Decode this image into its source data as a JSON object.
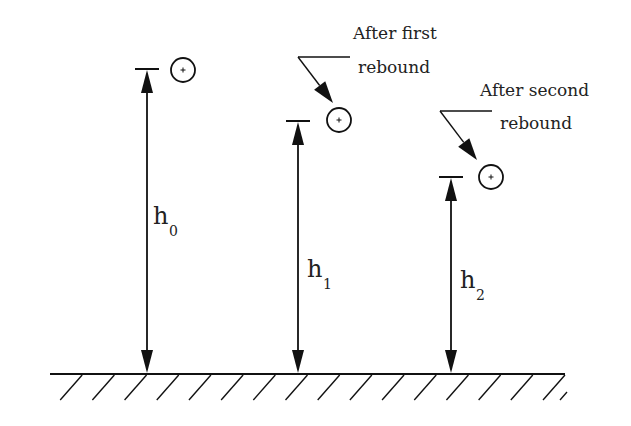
{
  "diagram": {
    "colors": {
      "stroke": "#111111",
      "background": "#ffffff",
      "text": "#222222"
    },
    "ground": {
      "y": 374,
      "x1": 50,
      "x2": 565,
      "hatch_count": 16
    },
    "heights": [
      {
        "id": "h0",
        "symbol": "h",
        "subscript": "0",
        "x": 147,
        "top": 69,
        "label_x": 153,
        "label_y": 224,
        "sub_x": 169,
        "sub_y": 236,
        "ball": {
          "cx": 183,
          "cy": 70,
          "r": 12
        }
      },
      {
        "id": "h1",
        "symbol": "h",
        "subscript": "1",
        "x": 298,
        "top": 121,
        "label_x": 307,
        "label_y": 277,
        "sub_x": 323,
        "sub_y": 289,
        "ball": {
          "cx": 339,
          "cy": 120,
          "r": 12
        }
      },
      {
        "id": "h2",
        "symbol": "h",
        "subscript": "2",
        "x": 451,
        "top": 177,
        "label_x": 460,
        "label_y": 288,
        "sub_x": 476,
        "sub_y": 300,
        "ball": {
          "cx": 491,
          "cy": 177,
          "r": 12
        }
      }
    ],
    "annotations": [
      {
        "id": "after-first",
        "line1": "After first",
        "line2": "rebound",
        "l1_x": 353,
        "l1_y": 39,
        "l2_x": 358,
        "l2_y": 73,
        "leader": {
          "x1": 350,
          "y1": 57,
          "x2": 298,
          "y2": 57,
          "tip_x": 333,
          "tip_y": 103
        }
      },
      {
        "id": "after-second",
        "line1": "After second",
        "line2": "rebound",
        "l1_x": 480,
        "l1_y": 96,
        "l2_x": 500,
        "l2_y": 129,
        "leader": {
          "x1": 492,
          "y1": 111,
          "x2": 440,
          "y2": 111,
          "tip_x": 477,
          "tip_y": 160
        }
      }
    ]
  }
}
